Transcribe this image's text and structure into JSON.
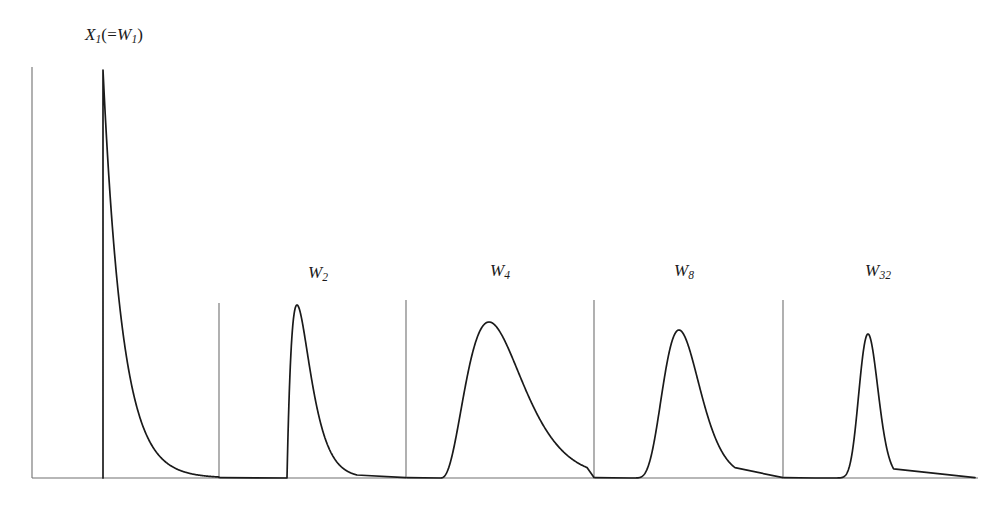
{
  "figure": {
    "title": "",
    "background_color": "#ffffff",
    "line_color": "#1a1a1a",
    "axis_color": "#707070",
    "width": 984,
    "height": 506
  },
  "labels": {
    "panel1_main": "X",
    "panel1_sub": "1",
    "panel1_paren_open": "(=",
    "panel1_w": "W",
    "panel1_wsub": "1",
    "panel1_paren_close": ")",
    "panel2_main": "W",
    "panel2_sub": "2",
    "panel3_main": "W",
    "panel3_sub": "4",
    "panel4_main": "W",
    "panel4_sub": "8",
    "panel5_main": "W",
    "panel5_sub": "32"
  },
  "chart_data": {
    "type": "line",
    "title": "",
    "subtitle": "",
    "xlabel": "",
    "ylabel": "",
    "grid": false,
    "legend": "none",
    "panels": [
      {
        "name": "X1",
        "label": "X_1(=W_1)",
        "shape_k": 1,
        "distribution": "exponential",
        "axis_x": 32,
        "axis_top_y": 67,
        "baseline_y": 478,
        "curve_start_x": 103,
        "curve_end_x": 219,
        "peak_x": 103,
        "peak_y": 70,
        "peak_height_px": 408,
        "x": [
          0.0,
          0.02,
          0.05,
          0.1,
          0.15,
          0.2,
          0.3,
          0.4,
          0.5,
          0.65,
          0.8,
          1.0,
          1.2,
          1.4,
          1.6,
          1.8,
          2.0
        ],
        "y": [
          1.0,
          0.87,
          0.73,
          0.55,
          0.42,
          0.33,
          0.2,
          0.13,
          0.085,
          0.045,
          0.025,
          0.012,
          0.006,
          0.003,
          0.0015,
          0.0008,
          0.0004
        ]
      },
      {
        "name": "W2",
        "label": "W_2",
        "shape_k": 2,
        "distribution": "gamma",
        "axis_x": 219,
        "axis_top_y": 303,
        "baseline_y": 478,
        "curve_start_x": 287,
        "curve_end_x": 406,
        "peak_x": 297,
        "peak_y": 305,
        "peak_height_px": 173,
        "x": [
          0.0,
          0.1,
          0.2,
          0.3,
          0.4,
          0.6,
          0.8,
          1.0,
          1.3,
          1.6,
          2.0,
          2.5,
          3.0,
          3.6
        ],
        "y": [
          0.0,
          0.95,
          1.0,
          0.92,
          0.8,
          0.58,
          0.4,
          0.27,
          0.15,
          0.08,
          0.035,
          0.013,
          0.005,
          0.0018
        ]
      },
      {
        "name": "W4",
        "label": "W_4",
        "shape_k": 4,
        "distribution": "gamma",
        "axis_x": 406,
        "axis_top_y": 300,
        "baseline_y": 478,
        "curve_start_x": 440,
        "curve_end_x": 594,
        "peak_x": 489,
        "peak_y": 322,
        "peak_height_px": 156,
        "x": [
          0.0,
          0.2,
          0.4,
          0.6,
          0.8,
          1.0,
          1.2,
          1.5,
          1.8,
          2.2,
          2.6,
          3.0,
          3.6,
          4.2,
          5.0
        ],
        "y": [
          0.0,
          0.05,
          0.3,
          0.65,
          0.9,
          1.0,
          0.97,
          0.82,
          0.62,
          0.39,
          0.23,
          0.13,
          0.055,
          0.022,
          0.007
        ]
      },
      {
        "name": "W8",
        "label": "W_8",
        "shape_k": 8,
        "distribution": "gamma",
        "axis_x": 594,
        "axis_top_y": 300,
        "baseline_y": 478,
        "curve_start_x": 630,
        "curve_end_x": 783,
        "peak_x": 679,
        "peak_y": 330,
        "peak_height_px": 148,
        "x": [
          0.0,
          0.3,
          0.5,
          0.7,
          0.85,
          1.0,
          1.15,
          1.35,
          1.6,
          1.9,
          2.3,
          2.8,
          3.4,
          4.2
        ],
        "y": [
          0.0,
          0.06,
          0.24,
          0.6,
          0.85,
          1.0,
          0.98,
          0.85,
          0.62,
          0.38,
          0.18,
          0.07,
          0.024,
          0.006
        ]
      },
      {
        "name": "W32",
        "label": "W_32",
        "shape_k": 32,
        "distribution": "gamma",
        "axis_x": 783,
        "axis_top_y": 300,
        "baseline_y": 478,
        "curve_start_x": 815,
        "curve_end_x": 975,
        "peak_x": 868,
        "peak_y": 334,
        "peak_height_px": 144,
        "x": [
          0.0,
          0.5,
          0.65,
          0.78,
          0.9,
          1.0,
          1.1,
          1.22,
          1.38,
          1.55,
          1.8,
          2.1,
          2.5,
          3.0
        ],
        "y": [
          0.0,
          0.05,
          0.22,
          0.55,
          0.86,
          1.0,
          0.96,
          0.8,
          0.55,
          0.32,
          0.13,
          0.04,
          0.008,
          0.001
        ]
      }
    ]
  }
}
